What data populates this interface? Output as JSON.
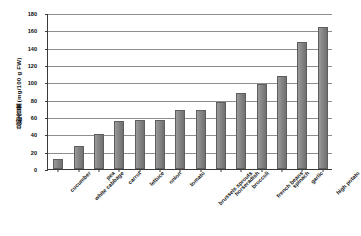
{
  "chart_data": {
    "type": "bar",
    "title": "",
    "xlabel": "",
    "ylabel": "总酚含量 (mg/100 g FW)",
    "ylim": [
      0,
      180
    ],
    "ytick_step": 20,
    "yticks": [
      0,
      20,
      40,
      60,
      80,
      100,
      120,
      140,
      160,
      180
    ],
    "grid": true,
    "legend": "none",
    "bar_color": "#808080",
    "categories": [
      "cucumber",
      "white cabbage",
      "pea",
      "carrot",
      "lettuce",
      "onion",
      "tomato",
      "brussels sprouts",
      "horseradish",
      "broccoli",
      "french beans",
      "spinach",
      "garlic",
      "high potato"
    ],
    "values": [
      12,
      26,
      40,
      55,
      56,
      57,
      68,
      68,
      77,
      88,
      98,
      107,
      146,
      164
    ]
  },
  "axis": {
    "y_title": "总酚含量 (mg/100 g FW)"
  }
}
